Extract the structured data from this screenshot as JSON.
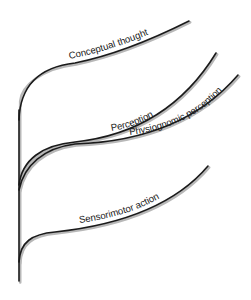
{
  "diagram": {
    "title": "",
    "colors": {
      "line": "#1a1a1a",
      "shadow": "#b8b8b8",
      "background": "#ffffff"
    },
    "trunk": {
      "label": ""
    },
    "branches": [
      {
        "id": "conceptual-thought",
        "label": "Conceptual thought"
      },
      {
        "id": "perception",
        "label": "Perception"
      },
      {
        "id": "physiognomic-perception",
        "label": "Physiognomic perception"
      },
      {
        "id": "sensorimotor-action",
        "label": "Sensorimotor action"
      }
    ]
  }
}
